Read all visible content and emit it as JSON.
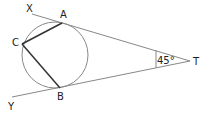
{
  "diagram": {
    "points": {
      "X": "X",
      "Y": "Y",
      "A": "A",
      "B": "B",
      "C": "C",
      "T": "T"
    },
    "angle_label": "45°",
    "colors": {
      "thin_line": "#888888",
      "chord": "#333333",
      "text": "#222222"
    }
  }
}
